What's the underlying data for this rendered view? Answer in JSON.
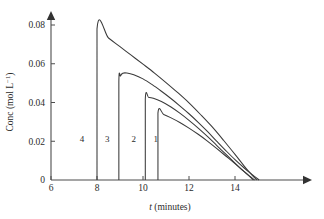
{
  "chart_data": {
    "type": "line",
    "title": "",
    "subtitle": "",
    "xlabel": "t (minutes)",
    "xlabel_italic_part": "t",
    "xlabel_rest": " (minutes)",
    "ylabel": "Conc (mol L⁻¹)",
    "ylabel_main": "Conc (mol L",
    "ylabel_sup": "−1",
    "ylabel_tail": ")",
    "xlim": [
      6,
      17
    ],
    "ylim": [
      0,
      0.088
    ],
    "xticks": [
      6,
      8,
      10,
      12,
      14
    ],
    "xtick_labels": [
      "6",
      "8",
      "10",
      "12",
      "14"
    ],
    "yticks": [
      0,
      0.02,
      0.04,
      0.06,
      0.08
    ],
    "ytick_labels": [
      "0",
      "0.02",
      "0.04",
      "0.06",
      "0.08"
    ],
    "grid": false,
    "legend": "none",
    "axis_arrows": true,
    "series": [
      {
        "name": "4",
        "label": "4",
        "label_x": 7.35,
        "label_y": 0.0195,
        "rise_time": 8.0,
        "peak": 0.078,
        "end_time": 14.95,
        "points": [
          [
            8.0,
            0.0
          ],
          [
            8.0,
            0.078
          ],
          [
            8.5,
            0.0733
          ],
          [
            9.0,
            0.0688
          ],
          [
            9.5,
            0.0643
          ],
          [
            10.0,
            0.0598
          ],
          [
            10.5,
            0.0552
          ],
          [
            11.0,
            0.0503
          ],
          [
            11.5,
            0.0452
          ],
          [
            12.0,
            0.0398
          ],
          [
            12.5,
            0.0338
          ],
          [
            13.0,
            0.0275
          ],
          [
            13.5,
            0.0205
          ],
          [
            14.0,
            0.0132
          ],
          [
            14.4,
            0.0072
          ],
          [
            14.7,
            0.003
          ],
          [
            14.95,
            0.0
          ]
        ]
      },
      {
        "name": "3",
        "label": "3",
        "label_x": 8.45,
        "label_y": 0.0195,
        "rise_time": 8.95,
        "peak": 0.0552,
        "end_time": 15.05,
        "points": [
          [
            8.95,
            0.0
          ],
          [
            8.95,
            0.0505
          ],
          [
            9.02,
            0.0537
          ],
          [
            9.12,
            0.0551
          ],
          [
            9.3,
            0.0552
          ],
          [
            9.6,
            0.0543
          ],
          [
            10.0,
            0.0522
          ],
          [
            10.4,
            0.0492
          ],
          [
            10.8,
            0.0458
          ],
          [
            11.2,
            0.0422
          ],
          [
            11.6,
            0.0383
          ],
          [
            12.0,
            0.0342
          ],
          [
            12.4,
            0.0298
          ],
          [
            12.8,
            0.0251
          ],
          [
            13.2,
            0.0201
          ],
          [
            13.6,
            0.0152
          ],
          [
            14.0,
            0.0105
          ],
          [
            14.4,
            0.0062
          ],
          [
            14.75,
            0.0028
          ],
          [
            15.05,
            0.0
          ]
        ]
      },
      {
        "name": "2",
        "label": "2",
        "label_x": 9.6,
        "label_y": 0.0195,
        "rise_time": 10.1,
        "peak": 0.0423,
        "end_time": 14.85,
        "points": [
          [
            10.1,
            0.0
          ],
          [
            10.1,
            0.0418
          ],
          [
            10.25,
            0.0426
          ],
          [
            10.45,
            0.0422
          ],
          [
            10.8,
            0.0405
          ],
          [
            11.2,
            0.0378
          ],
          [
            11.6,
            0.0345
          ],
          [
            12.0,
            0.0308
          ],
          [
            12.4,
            0.0268
          ],
          [
            12.8,
            0.0225
          ],
          [
            13.2,
            0.0179
          ],
          [
            13.6,
            0.0133
          ],
          [
            14.0,
            0.0087
          ],
          [
            14.35,
            0.0048
          ],
          [
            14.62,
            0.0021
          ],
          [
            14.85,
            0.0
          ]
        ]
      },
      {
        "name": "1",
        "label": "1",
        "label_x": 10.55,
        "label_y": 0.0195,
        "rise_time": 10.65,
        "peak": 0.0345,
        "end_time": 14.8,
        "points": [
          [
            10.65,
            0.0
          ],
          [
            10.65,
            0.0345
          ],
          [
            10.9,
            0.0338
          ],
          [
            11.2,
            0.0322
          ],
          [
            11.6,
            0.0297
          ],
          [
            12.0,
            0.0268
          ],
          [
            12.4,
            0.0236
          ],
          [
            12.8,
            0.0201
          ],
          [
            13.2,
            0.0163
          ],
          [
            13.6,
            0.0124
          ],
          [
            14.0,
            0.0084
          ],
          [
            14.35,
            0.0048
          ],
          [
            14.6,
            0.0023
          ],
          [
            14.8,
            0.0
          ]
        ]
      }
    ]
  }
}
